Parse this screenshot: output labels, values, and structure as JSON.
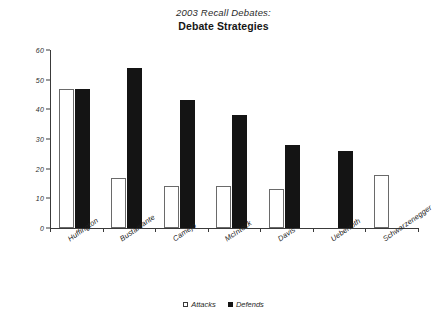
{
  "title": {
    "line1": "2003 Recall Debates:",
    "line2": "Debate Strategies"
  },
  "legend": {
    "attacks_label": "Attacks",
    "defends_label": "Defends"
  },
  "axis": {
    "ylabel": "#Attacks/Defends",
    "yticks": [
      "0",
      "10",
      "20",
      "30",
      "40",
      "50",
      "60"
    ]
  },
  "categories": [
    "Huffington",
    "Bustamante",
    "Camejo",
    "McIntock",
    "Davis",
    "Ueberroth",
    "Schwarzenegger"
  ],
  "chart_data": {
    "type": "bar",
    "title": "2003 Recall Debates: Debate Strategies",
    "xlabel": "",
    "ylabel": "#Attacks/Defends",
    "ylim": [
      0,
      60
    ],
    "ytick_step": 10,
    "grid": false,
    "legend_position": "bottom-center",
    "categories": [
      "Huffington",
      "Bustamante",
      "Camejo",
      "McIntock",
      "Davis",
      "Ueberroth",
      "Schwarzenegger"
    ],
    "series": [
      {
        "name": "Attacks",
        "color": "#ffffff",
        "edge_color": "#6a6a6a",
        "values": [
          47,
          17,
          14,
          14,
          13,
          null,
          18
        ]
      },
      {
        "name": "Defends",
        "color": "#141414",
        "edge_color": "#141414",
        "values": [
          47,
          54,
          43,
          38,
          28,
          26,
          null
        ]
      }
    ]
  }
}
